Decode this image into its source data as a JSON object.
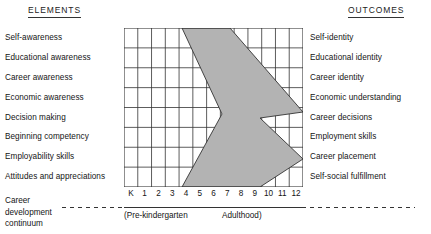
{
  "headers": {
    "left": "ELEMENTS",
    "right": "OUTCOMES"
  },
  "elements": [
    "Self-awareness",
    "Educational awareness",
    "Career awareness",
    "Economic awareness",
    "Decision making",
    "Beginning competency",
    "Employability skills",
    "Attitudes and appreciations"
  ],
  "outcomes": [
    "Self-identity",
    "Educational identity",
    "Career identity",
    "Economic understanding",
    "Career decisions",
    "Employment skills",
    "Career placement",
    "Self-social fulfillment"
  ],
  "axis": {
    "ticks": [
      "K",
      "1",
      "2",
      "3",
      "4",
      "5",
      "6",
      "7",
      "8",
      "9",
      "10",
      "11",
      "12"
    ]
  },
  "continuum": {
    "line1": "Career",
    "line2": "development",
    "line3": "continuum",
    "range_start": "(Pre-kindergarten",
    "range_end": "Adulthood)"
  },
  "chart_data": {
    "type": "diagram",
    "title": "Career development continuum",
    "grid": {
      "columns": 13,
      "rows": 8,
      "grid_on": true
    },
    "xlabel": "",
    "ylabel": "",
    "x_tick_labels": [
      "K",
      "1",
      "2",
      "3",
      "4",
      "5",
      "6",
      "7",
      "8",
      "9",
      "10",
      "11",
      "12"
    ],
    "row_categories_left": [
      "Self-awareness",
      "Educational awareness",
      "Career awareness",
      "Economic awareness",
      "Decision making",
      "Beginning competency",
      "Employability skills",
      "Attitudes and appreciations"
    ],
    "row_categories_right": [
      "Self-identity",
      "Educational identity",
      "Career identity",
      "Economic understanding",
      "Career decisions",
      "Employment skills",
      "Career placement",
      "Self-social fulfillment"
    ],
    "annotations": [
      "(Pre-kindergarten",
      "Adulthood)"
    ],
    "band_shape": "chevron",
    "band_fill": "#b3b3b3",
    "band_stroke": "#333333",
    "band_vertices_px": [
      [
        58,
        0
      ],
      [
        106,
        0
      ],
      [
        179,
        84
      ],
      [
        136,
        90
      ],
      [
        179,
        131
      ],
      [
        136,
        159
      ],
      [
        58,
        159
      ],
      [
        98,
        86
      ]
    ]
  },
  "colors": {
    "band_fill": "#b3b3b3",
    "line": "#333333",
    "text": "#141414",
    "background": "#ffffff"
  }
}
